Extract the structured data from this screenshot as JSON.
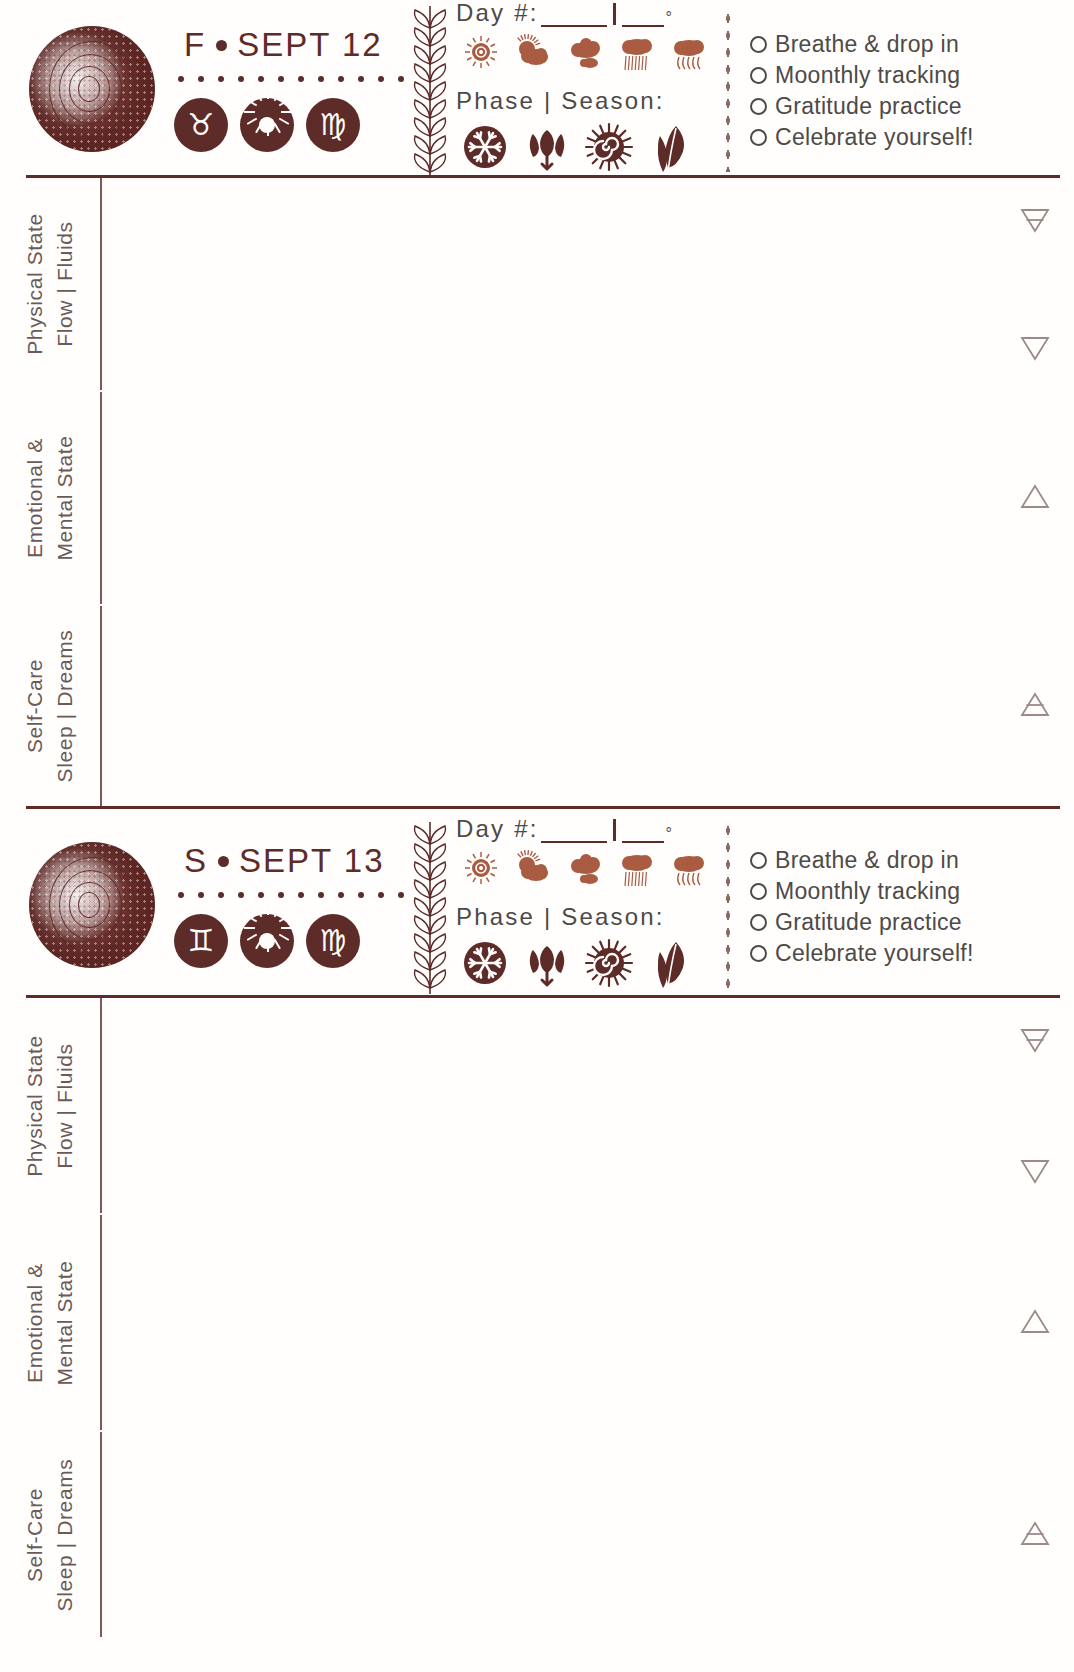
{
  "page": {
    "accent_color": "#5d2b28",
    "text_color": "#4d4a48",
    "label_color": "#6b5a57",
    "paper_color": "#fffefd"
  },
  "days": [
    {
      "weekday": "F",
      "date": "SEPT 12",
      "moon_icon": "spiral-moon-icon",
      "zodiac_badges": [
        {
          "name": "taurus-icon",
          "glyph": "♉"
        },
        {
          "name": "sun-icon",
          "glyph": "☉"
        },
        {
          "name": "virgo-icon",
          "glyph": "♍"
        }
      ],
      "day_number_label": "Day #:",
      "degree_symbol": "°",
      "phase_season_label": "Phase | Season:",
      "day_number_value": "",
      "temperature_value": "",
      "weather_icons": [
        "sun-icon",
        "partly-cloudy-icon",
        "cloudy-icon",
        "rain-icon",
        "storm-icon"
      ],
      "season_icons": [
        "snowflake-winter-icon",
        "tulip-spring-icon",
        "sun-spiral-summer-icon",
        "leaf-autumn-icon"
      ],
      "checklist": [
        "Breathe & drop in",
        "Moonthly tracking",
        "Gratitude practice",
        "Celebrate yourself!"
      ],
      "sections": [
        {
          "label_top": "Physical State",
          "label_bottom": "Flow | Fluids",
          "content": "",
          "element_marks": [
            "earth-symbol",
            "water-symbol"
          ]
        },
        {
          "label_top": "Emotional &",
          "label_bottom": "Mental State",
          "content": "",
          "element_marks": [
            "fire-symbol"
          ]
        },
        {
          "label_top": "Self-Care",
          "label_bottom": "Sleep | Dreams",
          "content": "",
          "element_marks": [
            "air-symbol"
          ]
        }
      ]
    },
    {
      "weekday": "S",
      "date": "SEPT 13",
      "moon_icon": "spiral-moon-icon",
      "zodiac_badges": [
        {
          "name": "gemini-icon",
          "glyph": "♊"
        },
        {
          "name": "sun-icon",
          "glyph": "☉"
        },
        {
          "name": "virgo-icon",
          "glyph": "♍"
        }
      ],
      "day_number_label": "Day #:",
      "degree_symbol": "°",
      "phase_season_label": "Phase | Season:",
      "day_number_value": "",
      "temperature_value": "",
      "weather_icons": [
        "sun-icon",
        "partly-cloudy-icon",
        "cloudy-icon",
        "rain-icon",
        "storm-icon"
      ],
      "season_icons": [
        "snowflake-winter-icon",
        "tulip-spring-icon",
        "sun-spiral-summer-icon",
        "leaf-autumn-icon"
      ],
      "checklist": [
        "Breathe & drop in",
        "Moonthly tracking",
        "Gratitude practice",
        "Celebrate yourself!"
      ],
      "sections": [
        {
          "label_top": "Physical State",
          "label_bottom": "Flow | Fluids",
          "content": "",
          "element_marks": [
            "earth-symbol",
            "water-symbol"
          ]
        },
        {
          "label_top": "Emotional &",
          "label_bottom": "Mental State",
          "content": "",
          "element_marks": [
            "fire-symbol"
          ]
        },
        {
          "label_top": "Self-Care",
          "label_bottom": "Sleep | Dreams",
          "content": "",
          "element_marks": [
            "air-symbol"
          ]
        }
      ]
    }
  ]
}
